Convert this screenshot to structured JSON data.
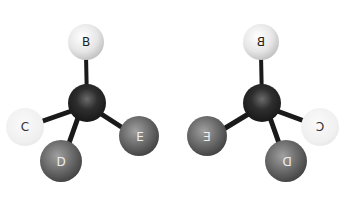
{
  "diagram": {
    "type": "molecular-enantiomers",
    "left_molecule": {
      "center": {
        "label": "",
        "x": 87,
        "y": 103,
        "r": 19,
        "shade": "dark"
      },
      "atoms": [
        {
          "id": "B",
          "label": "B",
          "x": 86,
          "y": 42,
          "r": 18,
          "shade": "light",
          "label_color": "#222222"
        },
        {
          "id": "C",
          "label": "C",
          "x": 25,
          "y": 127,
          "r": 19,
          "shade": "faded",
          "label_color": "#333333"
        },
        {
          "id": "D",
          "label": "D",
          "x": 61,
          "y": 161,
          "r": 21,
          "shade": "gray",
          "label_color": "#f0f0f0"
        },
        {
          "id": "E",
          "label": "E",
          "x": 139,
          "y": 136,
          "r": 20,
          "shade": "gray",
          "label_color": "#f0f0f0"
        }
      ]
    },
    "right_molecule": {
      "mirrored": true,
      "center": {
        "label": "",
        "x": 262,
        "y": 103,
        "r": 19,
        "shade": "dark"
      },
      "atoms": [
        {
          "id": "B",
          "label": "B",
          "x": 261,
          "y": 42,
          "r": 18,
          "shade": "light",
          "label_color": "#222222"
        },
        {
          "id": "C",
          "label": "C",
          "x": 320,
          "y": 127,
          "r": 19,
          "shade": "faded",
          "label_color": "#333333"
        },
        {
          "id": "D",
          "label": "D",
          "x": 286,
          "y": 161,
          "r": 21,
          "shade": "gray",
          "label_color": "#f0f0f0"
        },
        {
          "id": "E",
          "label": "E",
          "x": 207,
          "y": 136,
          "r": 20,
          "shade": "gray",
          "label_color": "#f0f0f0"
        }
      ]
    }
  }
}
